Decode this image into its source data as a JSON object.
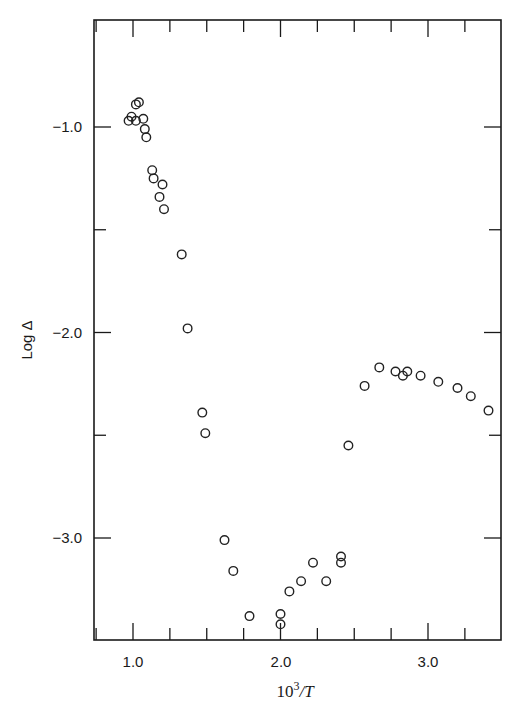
{
  "chart_data": {
    "type": "scatter",
    "title": "",
    "xlabel": "10^3/T",
    "xlabel_parts": {
      "base": "10",
      "sup": "3",
      "rest": "/T"
    },
    "ylabel": "Log Δ",
    "xlim": [
      0.74,
      3.5
    ],
    "ylim": [
      -3.49,
      -0.49
    ],
    "grid": false,
    "legend": null,
    "marker": "open-circle",
    "x_ticks": {
      "major": [
        1.0,
        2.0,
        3.0
      ],
      "major_labels": [
        "1.0",
        "2.0",
        "3.0"
      ],
      "minor_step": 0.25
    },
    "y_ticks": {
      "major": [
        -1.0,
        -2.0,
        -3.0
      ],
      "major_labels": [
        "-1.0",
        "-2.0",
        "-3.0"
      ],
      "minor": [
        -1.5,
        -2.5
      ]
    },
    "series": [
      {
        "name": "data",
        "points": [
          {
            "x": 0.97,
            "y": -0.97
          },
          {
            "x": 0.99,
            "y": -0.95
          },
          {
            "x": 1.02,
            "y": -0.97
          },
          {
            "x": 1.02,
            "y": -0.89
          },
          {
            "x": 1.04,
            "y": -0.88
          },
          {
            "x": 1.07,
            "y": -0.96
          },
          {
            "x": 1.08,
            "y": -1.01
          },
          {
            "x": 1.09,
            "y": -1.05
          },
          {
            "x": 1.13,
            "y": -1.21
          },
          {
            "x": 1.14,
            "y": -1.25
          },
          {
            "x": 1.2,
            "y": -1.28
          },
          {
            "x": 1.18,
            "y": -1.34
          },
          {
            "x": 1.21,
            "y": -1.4
          },
          {
            "x": 1.33,
            "y": -1.62
          },
          {
            "x": 1.37,
            "y": -1.98
          },
          {
            "x": 1.47,
            "y": -2.39
          },
          {
            "x": 1.49,
            "y": -2.49
          },
          {
            "x": 1.62,
            "y": -3.01
          },
          {
            "x": 1.68,
            "y": -3.16
          },
          {
            "x": 1.79,
            "y": -3.38
          },
          {
            "x": 2.0,
            "y": -3.37
          },
          {
            "x": 2.0,
            "y": -3.42
          },
          {
            "x": 2.06,
            "y": -3.26
          },
          {
            "x": 2.14,
            "y": -3.21
          },
          {
            "x": 2.22,
            "y": -3.12
          },
          {
            "x": 2.31,
            "y": -3.21
          },
          {
            "x": 2.41,
            "y": -3.09
          },
          {
            "x": 2.41,
            "y": -3.12
          },
          {
            "x": 2.46,
            "y": -2.55
          },
          {
            "x": 2.57,
            "y": -2.26
          },
          {
            "x": 2.67,
            "y": -2.17
          },
          {
            "x": 2.78,
            "y": -2.19
          },
          {
            "x": 2.83,
            "y": -2.21
          },
          {
            "x": 2.86,
            "y": -2.19
          },
          {
            "x": 2.95,
            "y": -2.21
          },
          {
            "x": 3.07,
            "y": -2.24
          },
          {
            "x": 3.2,
            "y": -2.27
          },
          {
            "x": 3.29,
            "y": -2.31
          },
          {
            "x": 3.41,
            "y": -2.38
          }
        ]
      }
    ]
  },
  "labels": {
    "y_axis_title": "Log Δ",
    "x_axis_base": "10",
    "x_axis_sup": "3",
    "x_axis_rest": "/T",
    "x_tick_1": "1.0",
    "x_tick_2": "2.0",
    "x_tick_3": "3.0",
    "y_tick_1": "−1.0",
    "y_tick_2": "−2.0",
    "y_tick_3": "−3.0"
  }
}
